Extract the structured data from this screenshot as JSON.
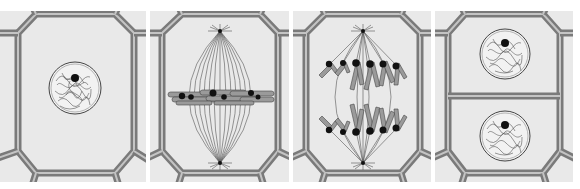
{
  "figure": {
    "colors": {
      "background": "#ffffff",
      "cytoplasm": "#e9e9e9",
      "wall_outer": "#7a7a7a",
      "wall_inner": "#c4c4c4",
      "chromatin": "#555555",
      "centromere": "#111111",
      "chromosome": "#9a9a9a",
      "spindle": "#555555"
    },
    "panels": [
      {
        "id": "interphase",
        "label": "Nucleus with chromatin",
        "x": 0,
        "width": 146
      },
      {
        "id": "metaphase",
        "label": "Chromosomes aligned on spindle equator",
        "x": 150,
        "width": 139
      },
      {
        "id": "anaphase",
        "label": "Sister chromatids separating to poles",
        "x": 293,
        "width": 138
      },
      {
        "id": "telophase",
        "label": "Two daughter cells with nuclei",
        "x": 435,
        "width": 138
      }
    ]
  }
}
